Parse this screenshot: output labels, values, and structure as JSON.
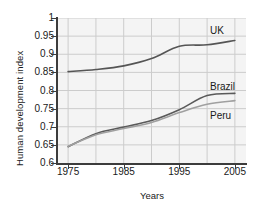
{
  "chart_data": {
    "type": "line",
    "title": "",
    "xlabel": "Years",
    "ylabel": "Human development index",
    "xlim": [
      1973,
      2007
    ],
    "ylim": [
      0.6,
      1.0
    ],
    "grid": true,
    "legend_position": "inline-right",
    "xticks": [
      1975,
      1985,
      1995,
      2005
    ],
    "xtick_labels": [
      "1975",
      "1985",
      "1995",
      "2005"
    ],
    "x_gridlines": [
      1975,
      1980,
      1985,
      1990,
      1995,
      2000,
      2005
    ],
    "yticks": [
      0.6,
      0.65,
      0.7,
      0.75,
      0.8,
      0.85,
      0.9,
      0.95,
      1
    ],
    "ytick_labels": [
      "0.6",
      "0.65",
      "0.7",
      "0.75",
      "0.8",
      "0.85",
      "0.9",
      "0.95",
      "1"
    ],
    "x": [
      1975,
      1980,
      1985,
      1990,
      1995,
      2000,
      2005
    ],
    "series": [
      {
        "name": "UK",
        "color": "#555555",
        "label_text": "UK",
        "values": [
          0.852,
          0.858,
          0.868,
          0.888,
          0.922,
          0.926,
          0.938
        ]
      },
      {
        "name": "Brazil",
        "color": "#5a5a5a",
        "label_text": "Brazil",
        "values": [
          0.645,
          0.681,
          0.699,
          0.717,
          0.747,
          0.786,
          0.792
        ]
      },
      {
        "name": "Peru",
        "color": "#a0a0a0",
        "label_text": "Peru",
        "values": [
          0.646,
          0.678,
          0.695,
          0.712,
          0.739,
          0.762,
          0.772
        ]
      }
    ]
  },
  "colors": {
    "plot_background": "#f4f4f4",
    "gridline": "#cccccc",
    "axis": "#3c3c3c",
    "page_background": "#ffffff",
    "text": "#1a1a1a"
  }
}
